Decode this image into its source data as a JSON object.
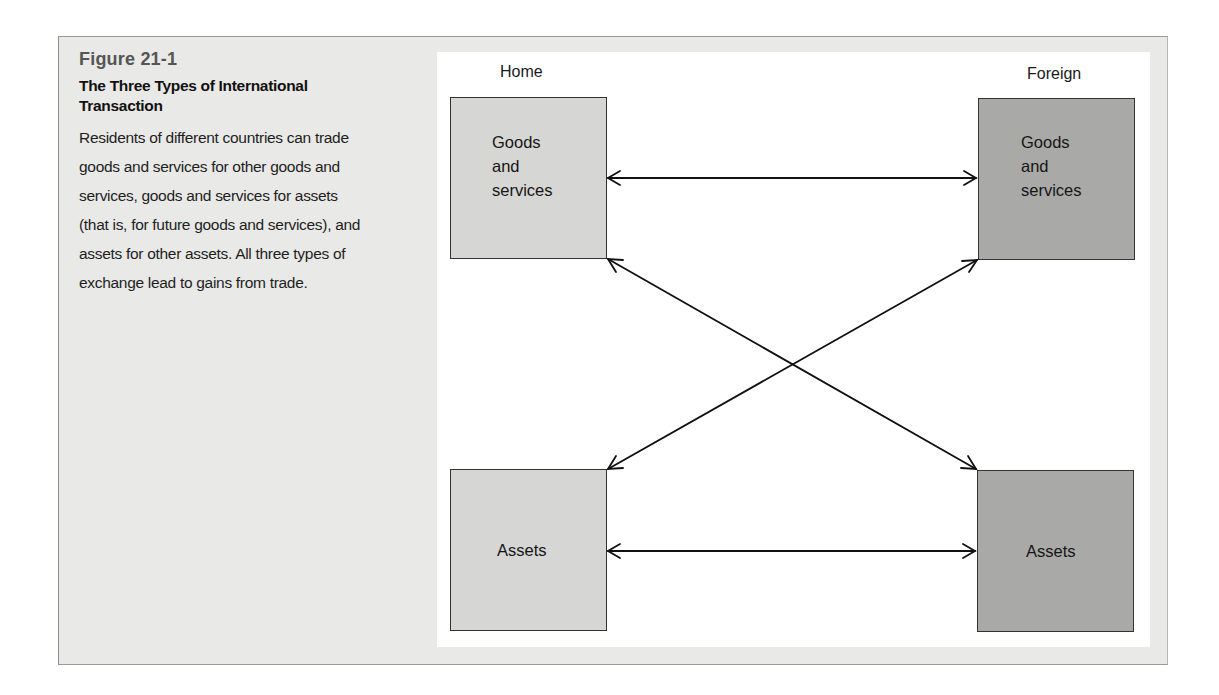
{
  "figure": {
    "label": "Figure 21-1",
    "title": "The Three Types of International Transaction",
    "description": "Residents of different countries can trade goods and services for other goods and services, goods and services for assets (that is, for future goods and services), and assets for other assets. All three types of exchange lead to gains from trade."
  },
  "diagram": {
    "columns": {
      "home": "Home",
      "foreign": "Foreign"
    },
    "boxes": {
      "home_goods": {
        "lines": [
          "Goods",
          "and",
          "services"
        ]
      },
      "foreign_goods": {
        "lines": [
          "Goods",
          "and",
          "services"
        ]
      },
      "home_assets": {
        "label": "Assets"
      },
      "foreign_assets": {
        "label": "Assets"
      }
    },
    "arrows": [
      {
        "from": "home_goods",
        "to": "foreign_goods",
        "type": "double"
      },
      {
        "from": "home_assets",
        "to": "foreign_assets",
        "type": "double"
      },
      {
        "from": "home_goods",
        "to": "foreign_assets",
        "type": "double"
      },
      {
        "from": "home_assets",
        "to": "foreign_goods",
        "type": "double"
      }
    ],
    "colors": {
      "home_fill": "#d6d6d4",
      "foreign_fill": "#a9a9a7",
      "frame_bg": "#e9e9e7",
      "panel_bg": "#ffffff"
    }
  }
}
